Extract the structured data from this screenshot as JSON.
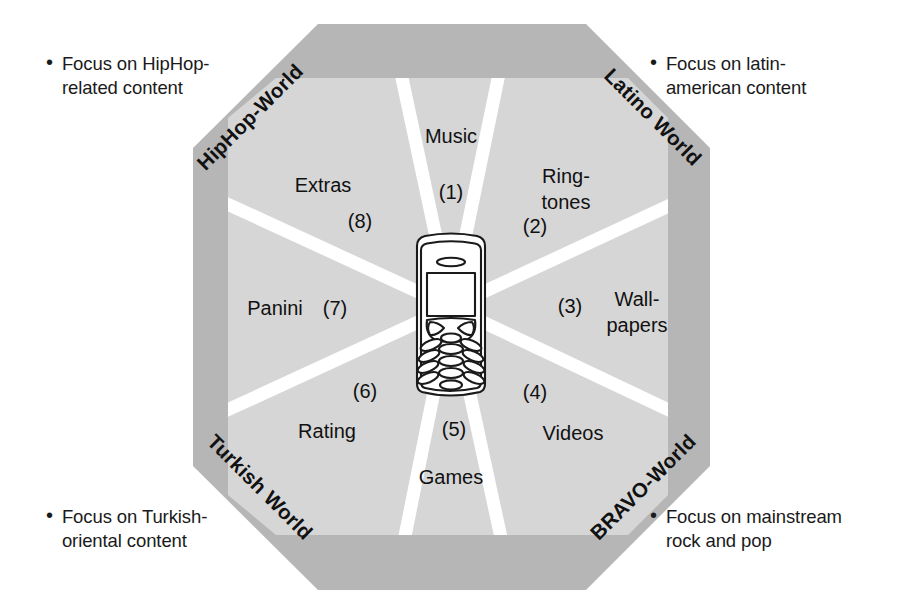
{
  "diagram": {
    "colors": {
      "outer_ring": "#b6b6b6",
      "inner_fill": "#d6d6d6",
      "spoke": "#ffffff",
      "background": "#ffffff",
      "text": "#111111",
      "phone_outline": "#1a1a1a",
      "phone_fill": "#ffffff"
    },
    "center_icon": "mobile-phone-icon",
    "worlds": [
      {
        "id": "hiphop",
        "label": "HipHop-World",
        "position": "top-left"
      },
      {
        "id": "latino",
        "label": "Latino World",
        "position": "top-right"
      },
      {
        "id": "bravo",
        "label": "BRAVO-World",
        "position": "bottom-right"
      },
      {
        "id": "turkish",
        "label": "Turkish World",
        "position": "bottom-left"
      }
    ],
    "segments": [
      {
        "number": "(1)",
        "label": "Music",
        "label_lines": [
          "Music"
        ]
      },
      {
        "number": "(2)",
        "label": "Ring-tones",
        "label_lines": [
          "Ring-",
          "tones"
        ]
      },
      {
        "number": "(3)",
        "label": "Wall-papers",
        "label_lines": [
          "Wall-",
          "papers"
        ]
      },
      {
        "number": "(4)",
        "label": "Videos",
        "label_lines": [
          "Videos"
        ]
      },
      {
        "number": "(5)",
        "label": "Games",
        "label_lines": [
          "Games"
        ]
      },
      {
        "number": "(6)",
        "label": "Rating",
        "label_lines": [
          "Rating"
        ]
      },
      {
        "number": "(7)",
        "label": "Panini",
        "label_lines": [
          "Panini"
        ]
      },
      {
        "number": "(8)",
        "label": "Extras",
        "label_lines": [
          "Extras"
        ]
      }
    ],
    "notes": [
      {
        "id": "note-hiphop",
        "bullet": "•",
        "text": "Focus on HipHop-\nrelated content"
      },
      {
        "id": "note-latino",
        "bullet": "•",
        "text": "Focus on latin-\namerican content"
      },
      {
        "id": "note-turkish",
        "bullet": "•",
        "text": "Focus on Turkish-\noriental content"
      },
      {
        "id": "note-bravo",
        "bullet": "•",
        "text": "Focus on mainstream\nrock and pop"
      }
    ]
  }
}
